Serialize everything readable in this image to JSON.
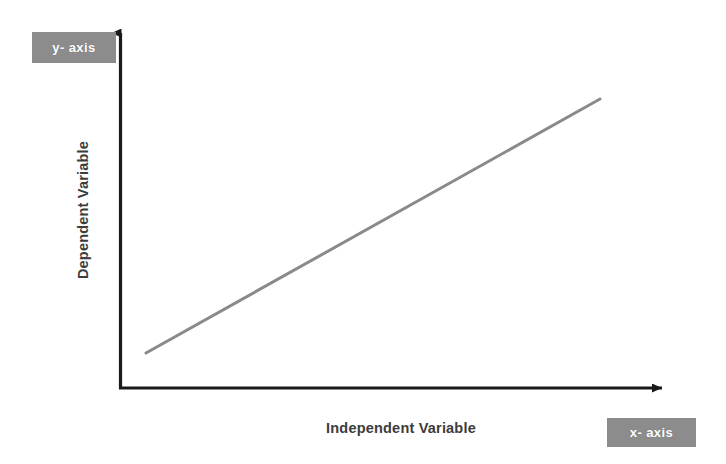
{
  "figure": {
    "background_color": "#ffffff",
    "width": 726,
    "height": 464
  },
  "callouts": {
    "y_axis_label": "y- axis",
    "x_axis_label": "x- axis",
    "box_color": "#8c8c8c",
    "text_color": "#ffffff"
  },
  "axis_titles": {
    "y": "Dependent Variable",
    "x": "Independent Variable",
    "color": "#3c3c3c"
  },
  "chart_data": {
    "type": "line",
    "title": "",
    "subtitle": "",
    "xlabel": "Independent Variable",
    "ylabel": "Dependent Variable",
    "grid": false,
    "legend": false,
    "legend_position": "none",
    "annotations": [
      {
        "text": "y- axis",
        "target": "y-axis",
        "style": "white-on-gray-box"
      },
      {
        "text": "x- axis",
        "target": "x-axis",
        "style": "white-on-gray-box"
      }
    ],
    "axis_style": {
      "arrows": true,
      "color": "#1a1a1a",
      "width_px": 3,
      "ticks": false,
      "tick_labels": false,
      "spines": [
        "left",
        "bottom"
      ]
    },
    "xlim": [
      0,
      1
    ],
    "ylim": [
      0,
      1
    ],
    "series": [
      {
        "name": "positive linear relationship",
        "color": "#8a8a8a",
        "width_px": 3,
        "marker": "none",
        "x": [
          0.05,
          1.0
        ],
        "y": [
          0.1,
          0.8
        ],
        "relationship": "positive",
        "slope_description": "steady positive linear increase"
      }
    ]
  },
  "geometry": {
    "origin": {
      "x": 120,
      "y": 389
    },
    "y_axis_tip": {
      "x": 120,
      "y": 24
    },
    "x_axis_tip": {
      "x": 672,
      "y": 389
    },
    "trend_start": {
      "x": 146,
      "y": 353
    },
    "trend_end": {
      "x": 600,
      "y": 99
    }
  }
}
